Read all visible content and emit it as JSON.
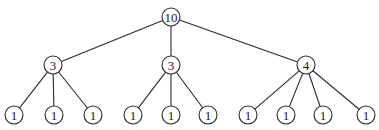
{
  "diagram": {
    "type": "tree",
    "colors": {
      "stroke": "#2a2a2a",
      "text": "#1a1a1a",
      "fill": "#ffffff"
    },
    "node_radius": 9,
    "nodes": [
      {
        "id": "root",
        "label": "10",
        "x": 171,
        "y": 17
      },
      {
        "id": "m1",
        "label": "3",
        "x": 53,
        "y": 65,
        "parent": "root"
      },
      {
        "id": "m2",
        "label": "3",
        "x": 171,
        "y": 65,
        "parent": "root"
      },
      {
        "id": "m3",
        "label": "4",
        "x": 306,
        "y": 65,
        "parent": "root"
      },
      {
        "id": "l1",
        "label": "1",
        "x": 14,
        "y": 115,
        "parent": "m1"
      },
      {
        "id": "l2",
        "label": "1",
        "x": 54,
        "y": 115,
        "parent": "m1"
      },
      {
        "id": "l3",
        "label": "1",
        "x": 93,
        "y": 115,
        "parent": "m1"
      },
      {
        "id": "l4",
        "label": "1",
        "x": 133,
        "y": 115,
        "parent": "m2"
      },
      {
        "id": "l5",
        "label": "1",
        "x": 171,
        "y": 115,
        "parent": "m2"
      },
      {
        "id": "l6",
        "label": "1",
        "x": 208,
        "y": 115,
        "parent": "m2"
      },
      {
        "id": "l7",
        "label": "1",
        "x": 248,
        "y": 115,
        "parent": "m3"
      },
      {
        "id": "l8",
        "label": "1",
        "x": 286,
        "y": 115,
        "parent": "m3"
      },
      {
        "id": "l9",
        "label": "1",
        "x": 323,
        "y": 115,
        "parent": "m3"
      },
      {
        "id": "l10",
        "label": "1",
        "x": 366,
        "y": 115,
        "parent": "m3"
      }
    ]
  }
}
